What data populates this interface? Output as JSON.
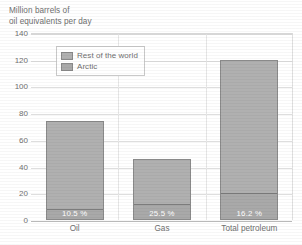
{
  "chart_data": {
    "type": "bar",
    "subtype": "stacked-bar",
    "title": "Million barrels of oil equivalents per day",
    "title_lines": [
      "Million barrels of",
      "oil equivalents per day"
    ],
    "xlabel": "",
    "ylabel": "Million barrels of oil equivalents per day",
    "ylim": [
      0,
      140
    ],
    "yticks": [
      0,
      20,
      40,
      60,
      80,
      100,
      120,
      140
    ],
    "ytick_labels": [
      "0",
      "20",
      "40",
      "60",
      "80",
      "100",
      "120",
      "140"
    ],
    "grid": true,
    "grid_axis": "y",
    "legend_position": "upper-left-inside",
    "categories": [
      "Oil",
      "Gas",
      "Total petroleum"
    ],
    "series": [
      {
        "name": "Arctic",
        "color": "#a9a9a9",
        "values": [
          7.8,
          11.6,
          19.4
        ]
      },
      {
        "name": "Rest of the world",
        "color": "#b0b0b0",
        "values": [
          66.2,
          34.0,
          100.6
        ]
      }
    ],
    "totals": [
      74.0,
      45.6,
      120.0
    ],
    "data_labels": [
      "10.5 %",
      "25.5 %",
      "16.2 %"
    ],
    "data_label_series": "Arctic",
    "annotations": []
  },
  "legend": {
    "items": [
      {
        "label": "Rest of the world",
        "color": "#b0b0b0"
      },
      {
        "label": "Arctic",
        "color": "#a9a9a9"
      }
    ]
  },
  "axis": {
    "title_line1": "Million barrels of",
    "title_line2": "oil equivalents per day",
    "yticks": [
      "140",
      "120",
      "100",
      "80",
      "60",
      "40",
      "20",
      "0"
    ]
  },
  "bars": [
    {
      "category": "Oil",
      "total": 74.0,
      "arctic": 7.8,
      "rest": 66.2,
      "pct": "10.5 %"
    },
    {
      "category": "Gas",
      "total": 45.6,
      "arctic": 11.6,
      "rest": 34.0,
      "pct": "25.5 %"
    },
    {
      "category": "Total petroleum",
      "total": 120.0,
      "arctic": 19.4,
      "rest": 100.6,
      "pct": "16.2 %"
    }
  ],
  "colors": {
    "rest_of_world": "#b0b0b0",
    "arctic": "#a9a9a9",
    "bar_border": "#8a8a8a",
    "gridline": "#dedede",
    "text": "#6f6f6f"
  }
}
